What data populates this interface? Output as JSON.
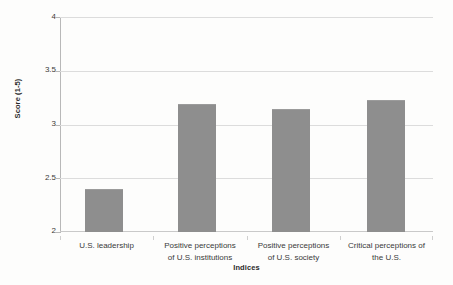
{
  "chart_data": {
    "type": "bar",
    "title": "",
    "subtitle": "",
    "xlabel": "Indices",
    "ylabel": "Score (1-5)",
    "categories": [
      "U.S. leadership",
      "Positive perceptions of U.S. institutions",
      "Positive perceptions of U.S. society",
      "Critical perceptions of the U.S."
    ],
    "category_lines": [
      [
        "U.S. leadership"
      ],
      [
        "Positive perceptions",
        "of U.S. institutions"
      ],
      [
        "Positive perceptions",
        "of U.S. society"
      ],
      [
        "Critical perceptions of",
        "the U.S."
      ]
    ],
    "values": [
      2.4,
      3.2,
      3.15,
      3.23
    ],
    "ylim": [
      2,
      4
    ],
    "yticks": [
      2,
      2.5,
      3,
      3.5,
      4
    ],
    "ytick_labels": [
      "2",
      "2.5",
      "3",
      "3.5",
      "4"
    ],
    "grid": true,
    "legend": null,
    "bar_color": "#8e8e8e",
    "gridline_color": "#dcdcdc",
    "axis_color": "#b8b8b8",
    "text_color": "#3a3a3a",
    "background": "#fdfdfc"
  }
}
